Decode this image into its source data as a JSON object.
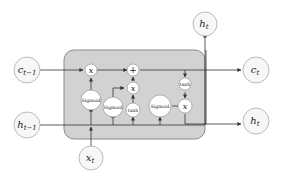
{
  "diagram": {
    "colors": {
      "cell_bg": "#d2d2d2",
      "cell_border": "#8a8a8a",
      "node_fill": "#f7f7f7",
      "line": "#333333"
    },
    "inputs": {
      "c_prev": "c",
      "c_prev_sub": "t−1",
      "h_prev": "h",
      "h_prev_sub": "t−1",
      "x_t": "x",
      "x_t_sub": "t"
    },
    "outputs": {
      "c_t": "c",
      "c_t_sub": "t",
      "h_t_top": "h",
      "h_t_top_sub": "t",
      "h_t_right": "h",
      "h_t_right_sub": "t"
    },
    "ops": {
      "forget_mult": "x",
      "add": "+",
      "input_mult": "x",
      "output_mult": "x",
      "tanh_candidate": "tanh",
      "tanh_output": "tanh",
      "sigmoid_forget": "Sigmoid",
      "sigmoid_input": "Sigmoid",
      "sigmoid_output": "Sigmoid"
    }
  }
}
